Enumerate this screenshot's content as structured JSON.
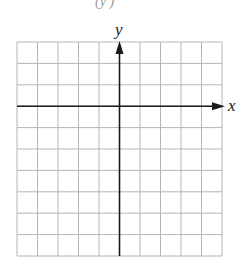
{
  "diagram": {
    "type": "coordinate-grid",
    "columns": 10,
    "rows": 10,
    "y_axis_column": 5,
    "x_axis_row": 3,
    "x_label": "x",
    "y_label": "y",
    "top_partial_text": "(y  )",
    "colors": {
      "grid": "#b5b5b5",
      "axis": "#1a1a1a",
      "background": "#ffffff"
    }
  }
}
